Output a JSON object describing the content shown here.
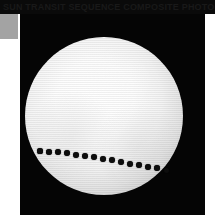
{
  "image": {
    "subject": "solar-transit-composite",
    "description": "Composite photograph of a planetary transit across the solar disk, showing a sequence of dark planet silhouettes tracing a shallow arc across the lower portion of the Sun.",
    "background_color": "#050505",
    "page_color": "#ffffff"
  },
  "banner": {
    "caption": "SUN TRANSIT SEQUENCE COMPOSITE PHOTOGRAPH",
    "background_color": "#0a0a0a",
    "text_color": "#191919"
  },
  "swatch": {
    "label": "gray-reference-patch",
    "color": "#a3a3a3"
  },
  "photo": {
    "frame": {
      "left": 20,
      "top": 14,
      "width": 185,
      "height": 201
    },
    "sun": {
      "label": "solar-disk",
      "center_x": 104,
      "center_y": 116,
      "diameter": 158,
      "core_color": "#ffffff",
      "limb_color": "#6e6e6e"
    },
    "transit": {
      "label": "planet-transit-track",
      "dot_color": "#0d0d0d",
      "count": 15,
      "dots": [
        {
          "x": 40,
          "y": 151,
          "r": 2.6
        },
        {
          "x": 49,
          "y": 152,
          "r": 2.8
        },
        {
          "x": 58,
          "y": 152,
          "r": 2.9
        },
        {
          "x": 67,
          "y": 153,
          "r": 2.9
        },
        {
          "x": 76,
          "y": 155,
          "r": 3.0
        },
        {
          "x": 85,
          "y": 156,
          "r": 3.0
        },
        {
          "x": 94,
          "y": 157,
          "r": 3.0
        },
        {
          "x": 103,
          "y": 159,
          "r": 3.0
        },
        {
          "x": 112,
          "y": 160,
          "r": 3.0
        },
        {
          "x": 121,
          "y": 162,
          "r": 3.0
        },
        {
          "x": 130,
          "y": 164,
          "r": 3.0
        },
        {
          "x": 139,
          "y": 165,
          "r": 2.9
        },
        {
          "x": 148,
          "y": 167,
          "r": 2.9
        },
        {
          "x": 157,
          "y": 168,
          "r": 2.8
        },
        {
          "x": 166,
          "y": 170,
          "r": 2.5
        }
      ]
    }
  }
}
